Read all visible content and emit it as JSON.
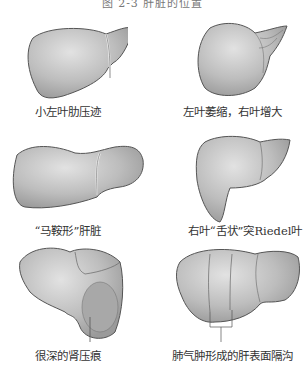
{
  "figure": {
    "title": "图 2-3 肝脏的位置",
    "panels": [
      {
        "id": "small-left-lobe",
        "caption": "小左叶肋压迹"
      },
      {
        "id": "left-atrophy-right-enlarged",
        "caption": "左叶萎缩，右叶增大"
      },
      {
        "id": "saddle-shaped",
        "caption": "“马鞍形”肝脏"
      },
      {
        "id": "riedel-lobe",
        "caption": "右叶“舌状”突Riedel叶"
      },
      {
        "id": "deep-renal-impression",
        "caption": "很深的肾压痕"
      },
      {
        "id": "emphysema-grooves",
        "caption": "肺气肿形成的肝表面隔沟"
      }
    ],
    "colors": {
      "organ_fill": "#bdbdbd",
      "organ_light": "#dcdcdc",
      "outline": "#555555",
      "text": "#333333"
    }
  }
}
